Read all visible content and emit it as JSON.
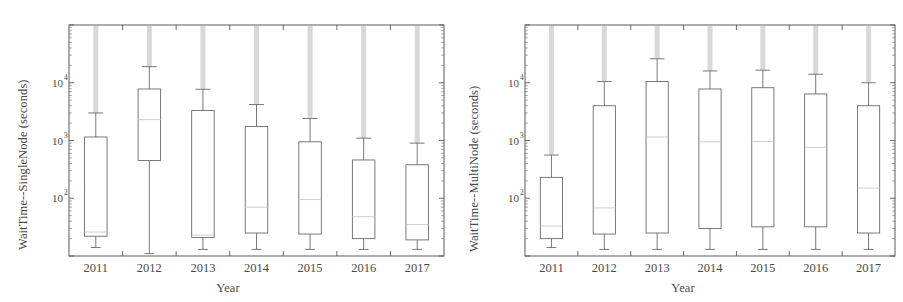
{
  "figure": {
    "panel_count": 2,
    "background_color": "#ffffff",
    "box_stroke_color": "#6a6a6a",
    "median_color": "#c9c9c9",
    "outlier_color": "#d2d2d2"
  },
  "chart_data": [
    {
      "type": "box",
      "panel": "left",
      "title": "",
      "xlabel": "Year",
      "ylabel": "WaitTime--SingleNode (seconds)",
      "yscale": "log",
      "ylim": [
        10,
        100000
      ],
      "ytick_values": [
        100,
        1000,
        10000
      ],
      "ytick_labels": [
        "10^2",
        "10^3",
        "10^4"
      ],
      "ytick_mantissa": [
        "10",
        "10",
        "10"
      ],
      "ytick_exponent": [
        "2",
        "3",
        "4"
      ],
      "grid": false,
      "legend": "none",
      "categories": [
        "2011",
        "2012",
        "2013",
        "2014",
        "2015",
        "2016",
        "2017"
      ],
      "boxes": [
        {
          "category": "2011",
          "whisker_low": 14,
          "q1": 22,
          "median": 26,
          "q3": 1150,
          "whisker_high": 3000,
          "outliers_to": 100000
        },
        {
          "category": "2012",
          "whisker_low": 11,
          "q1": 450,
          "median": 2300,
          "q3": 7800,
          "whisker_high": 19000,
          "outliers_to": 100000
        },
        {
          "category": "2013",
          "whisker_low": 13,
          "q1": 21,
          "median": 23,
          "q3": 3300,
          "whisker_high": 7700,
          "outliers_to": 100000
        },
        {
          "category": "2014",
          "whisker_low": 13,
          "q1": 25,
          "median": 70,
          "q3": 1750,
          "whisker_high": 4200,
          "outliers_to": 100000
        },
        {
          "category": "2015",
          "whisker_low": 13,
          "q1": 24,
          "median": 95,
          "q3": 950,
          "whisker_high": 2400,
          "outliers_to": 100000
        },
        {
          "category": "2016",
          "whisker_low": 13,
          "q1": 20,
          "median": 48,
          "q3": 460,
          "whisker_high": 1100,
          "outliers_to": 100000
        },
        {
          "category": "2017",
          "whisker_low": 13,
          "q1": 19,
          "median": 35,
          "q3": 380,
          "whisker_high": 900,
          "outliers_to": 100000
        }
      ]
    },
    {
      "type": "box",
      "panel": "right",
      "title": "",
      "xlabel": "Year",
      "ylabel": "WaitTime--MultiNode (seconds)",
      "yscale": "log",
      "ylim": [
        10,
        100000
      ],
      "ytick_values": [
        100,
        1000,
        10000
      ],
      "ytick_labels": [
        "10^2",
        "10^3",
        "10^4"
      ],
      "ytick_mantissa": [
        "10",
        "10",
        "10"
      ],
      "ytick_exponent": [
        "2",
        "3",
        "4"
      ],
      "grid": false,
      "legend": "none",
      "categories": [
        "2011",
        "2012",
        "2013",
        "2014",
        "2015",
        "2016",
        "2017"
      ],
      "boxes": [
        {
          "category": "2011",
          "whisker_low": 14,
          "q1": 20,
          "median": 33,
          "q3": 230,
          "whisker_high": 560,
          "outliers_to": 100000
        },
        {
          "category": "2012",
          "whisker_low": 13,
          "q1": 24,
          "median": 68,
          "q3": 4000,
          "whisker_high": 10500,
          "outliers_to": 100000
        },
        {
          "category": "2013",
          "whisker_low": 13,
          "q1": 25,
          "median": 1150,
          "q3": 10500,
          "whisker_high": 26000,
          "outliers_to": 100000
        },
        {
          "category": "2014",
          "whisker_low": 13,
          "q1": 30,
          "median": 950,
          "q3": 7800,
          "whisker_high": 16000,
          "outliers_to": 100000
        },
        {
          "category": "2015",
          "whisker_low": 13,
          "q1": 32,
          "median": 960,
          "q3": 8200,
          "whisker_high": 16500,
          "outliers_to": 100000
        },
        {
          "category": "2016",
          "whisker_low": 13,
          "q1": 32,
          "median": 760,
          "q3": 6400,
          "whisker_high": 14000,
          "outliers_to": 100000
        },
        {
          "category": "2017",
          "whisker_low": 13,
          "q1": 25,
          "median": 150,
          "q3": 4000,
          "whisker_high": 10000,
          "outliers_to": 100000
        }
      ]
    }
  ]
}
